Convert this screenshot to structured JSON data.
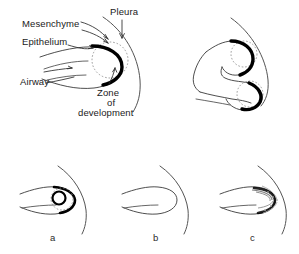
{
  "figure": {
    "title_present": false,
    "background_color": "#ffffff",
    "ink_color": "#000000",
    "dotted_color": "#8a8a8a",
    "outline_color": "#3a3a3a"
  },
  "labels": {
    "mesenchyme": "Mesenchyme",
    "epithelium": "Epithelium",
    "airway": "Airway",
    "pleura": "Pleura",
    "zone_line1": "Zone",
    "zone_line2": "of",
    "zone_line3": "development"
  },
  "panels": [
    {
      "id": "a",
      "label": "a",
      "description": "airway tip with detached ring of developing tissue"
    },
    {
      "id": "b",
      "label": "b",
      "description": "airway tip with no thickened epithelium"
    },
    {
      "id": "c",
      "label": "c",
      "description": "airway tip with diffuse stippled thickening"
    }
  ],
  "icons": {
    "arrow": "arrow-icon",
    "leader": "leader-line-icon",
    "dotted_circle": "dotted-circle-icon"
  }
}
